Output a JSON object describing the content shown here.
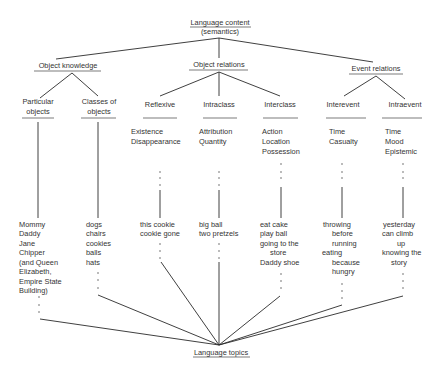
{
  "diagram": {
    "root": {
      "title": "Language content",
      "subtitle": "(semantics)"
    },
    "sink": {
      "title": "Language topics"
    },
    "categories": [
      {
        "label": "Object knowledge"
      },
      {
        "label": "Object relations"
      },
      {
        "label": "Event relations"
      }
    ],
    "columns": [
      {
        "heading": [
          "Particular",
          "objects"
        ],
        "subtypes": [],
        "examples": [
          "Mommy",
          "Daddy",
          "Jane",
          "Chipper",
          "(and Queen",
          "Elizabeth,",
          "Empire State",
          "Building)"
        ]
      },
      {
        "heading": [
          "Classes of",
          "objects"
        ],
        "subtypes": [],
        "examples": [
          "dogs",
          "chairs",
          "cookies",
          "balls",
          "hats"
        ]
      },
      {
        "heading": [
          "Reflexive"
        ],
        "subtypes": [
          "Existence",
          "Disappearance"
        ],
        "examples": [
          "this cookie",
          "cookie gone"
        ]
      },
      {
        "heading": [
          "Intraclass"
        ],
        "subtypes": [
          "Attribution",
          "Quantity"
        ],
        "examples": [
          "big ball",
          "two pretzels"
        ]
      },
      {
        "heading": [
          "Interclass"
        ],
        "subtypes": [
          "Action",
          "Location",
          "Possession"
        ],
        "examples": [
          "eat cake",
          "play ball",
          "going to the",
          "store",
          "Daddy shoe"
        ]
      },
      {
        "heading": [
          "Interevent"
        ],
        "subtypes": [
          "Time",
          "Casualty"
        ],
        "examples": [
          "throwing",
          "before",
          "running",
          "eating",
          "because",
          "hungry"
        ]
      },
      {
        "heading": [
          "Intraevent"
        ],
        "subtypes": [
          "Time",
          "Mood",
          "Epistemic"
        ],
        "examples": [
          "yesterday",
          "can climb",
          "up",
          "knowing the",
          "story"
        ]
      }
    ]
  }
}
